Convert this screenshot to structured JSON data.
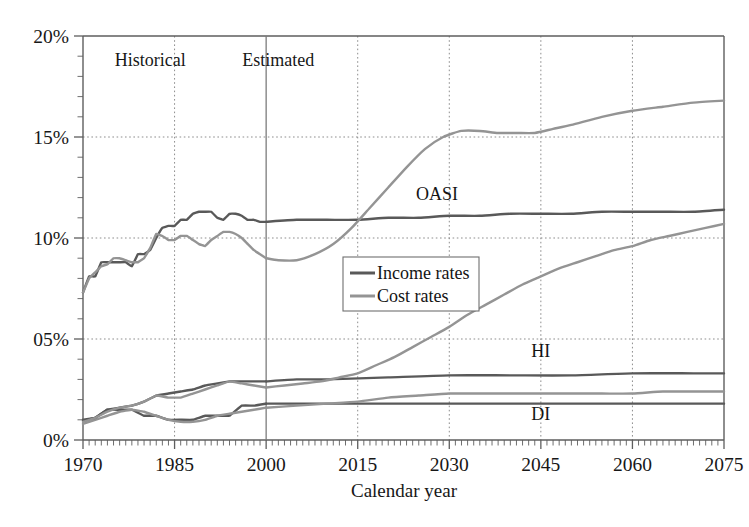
{
  "chart_data": {
    "type": "line",
    "title": "",
    "xlabel": "Calendar year",
    "ylabel": "",
    "xlim": [
      1970,
      2075
    ],
    "ylim": [
      0,
      20
    ],
    "grid": true,
    "grid_style": "dotted",
    "legend_position": "center",
    "x_ticks": [
      "1970",
      "1985",
      "2000",
      "2015",
      "2030",
      "2045",
      "2060",
      "2075"
    ],
    "x_tick_values": [
      1970,
      1985,
      2000,
      2015,
      2030,
      2045,
      2060,
      2075
    ],
    "y_ticks": [
      "0%",
      "05%",
      "10%",
      "15%",
      "20%"
    ],
    "y_tick_values": [
      0,
      5,
      10,
      15,
      20
    ],
    "minor_tick_interval_x": 1,
    "legend": [
      {
        "name": "Income rates",
        "color": "#595959"
      },
      {
        "name": "Cost rates",
        "color": "#949494"
      }
    ],
    "annotations": [
      {
        "text": "Historical",
        "x": 1981,
        "y": 18.5
      },
      {
        "text": "Estimated",
        "x": 2002,
        "y": 18.5
      },
      {
        "text": "OASI",
        "x": 2028,
        "y": 11.9
      },
      {
        "text": "HI",
        "x": 2045,
        "y": 4.1
      },
      {
        "text": "DI",
        "x": 2045,
        "y": 1.0
      }
    ],
    "divider": {
      "x": 2000,
      "label": "historical-estimated-divider",
      "color": "#7c7c7c"
    },
    "series": [
      {
        "name": "OASI income rate",
        "group": "OASI",
        "kind": "income",
        "color": "#595959",
        "x": [
          1970,
          1971,
          1972,
          1973,
          1974,
          1975,
          1976,
          1977,
          1978,
          1979,
          1980,
          1981,
          1982,
          1983,
          1984,
          1985,
          1986,
          1987,
          1988,
          1989,
          1990,
          1991,
          1992,
          1993,
          1994,
          1995,
          1996,
          1997,
          1998,
          1999,
          2000,
          2005,
          2010,
          2015,
          2020,
          2025,
          2030,
          2035,
          2040,
          2045,
          2050,
          2055,
          2060,
          2065,
          2070,
          2075
        ],
        "y": [
          7.3,
          8.1,
          8.1,
          8.8,
          8.8,
          8.8,
          8.8,
          8.8,
          8.6,
          9.2,
          9.2,
          9.4,
          10.0,
          10.5,
          10.6,
          10.6,
          10.9,
          10.9,
          11.2,
          11.3,
          11.3,
          11.3,
          11.0,
          10.9,
          11.2,
          11.2,
          11.1,
          10.9,
          10.9,
          10.8,
          10.8,
          10.9,
          10.9,
          10.9,
          11.0,
          11.0,
          11.1,
          11.1,
          11.2,
          11.2,
          11.2,
          11.3,
          11.3,
          11.3,
          11.3,
          11.4
        ]
      },
      {
        "name": "OASI cost rate",
        "group": "OASI",
        "kind": "cost",
        "color": "#949494",
        "x": [
          1970,
          1971,
          1972,
          1973,
          1974,
          1975,
          1976,
          1977,
          1978,
          1979,
          1980,
          1981,
          1982,
          1983,
          1984,
          1985,
          1986,
          1987,
          1988,
          1989,
          1990,
          1991,
          1992,
          1993,
          1994,
          1995,
          1996,
          1997,
          1998,
          1999,
          2000,
          2002,
          2005,
          2008,
          2011,
          2014,
          2017,
          2020,
          2023,
          2026,
          2029,
          2032,
          2035,
          2038,
          2041,
          2044,
          2047,
          2050,
          2055,
          2060,
          2065,
          2070,
          2075
        ],
        "y": [
          7.3,
          8.0,
          8.3,
          8.6,
          8.7,
          9.0,
          9.0,
          8.9,
          8.8,
          8.8,
          9.0,
          9.5,
          10.2,
          10.1,
          9.9,
          9.9,
          10.1,
          10.1,
          9.9,
          9.7,
          9.6,
          9.9,
          10.1,
          10.3,
          10.3,
          10.2,
          10.0,
          9.7,
          9.4,
          9.2,
          9.0,
          8.9,
          8.9,
          9.2,
          9.7,
          10.5,
          11.5,
          12.5,
          13.5,
          14.4,
          15.0,
          15.3,
          15.3,
          15.2,
          15.2,
          15.2,
          15.4,
          15.6,
          16.0,
          16.3,
          16.5,
          16.7,
          16.8
        ]
      },
      {
        "name": "DI income rate",
        "group": "DI",
        "kind": "income",
        "color": "#595959",
        "x": [
          1970,
          1972,
          1974,
          1976,
          1978,
          1980,
          1982,
          1984,
          1986,
          1988,
          1990,
          1992,
          1994,
          1996,
          1998,
          2000,
          2005,
          2010,
          2020,
          2030,
          2040,
          2050,
          2060,
          2070,
          2075
        ],
        "y": [
          0.95,
          1.1,
          1.5,
          1.5,
          1.5,
          1.2,
          1.2,
          1.0,
          1.0,
          1.0,
          1.2,
          1.2,
          1.2,
          1.7,
          1.7,
          1.8,
          1.8,
          1.8,
          1.8,
          1.8,
          1.8,
          1.8,
          1.8,
          1.8,
          1.8
        ]
      },
      {
        "name": "DI cost rate",
        "group": "DI",
        "kind": "cost",
        "color": "#949494",
        "x": [
          1970,
          1972,
          1974,
          1976,
          1978,
          1980,
          1982,
          1984,
          1986,
          1988,
          1990,
          1992,
          1994,
          1996,
          1998,
          2000,
          2005,
          2010,
          2015,
          2020,
          2025,
          2030,
          2035,
          2040,
          2045,
          2050,
          2055,
          2060,
          2065,
          2070,
          2075
        ],
        "y": [
          0.8,
          1.0,
          1.2,
          1.4,
          1.5,
          1.4,
          1.2,
          1.0,
          0.9,
          0.9,
          1.0,
          1.2,
          1.3,
          1.4,
          1.5,
          1.6,
          1.7,
          1.8,
          1.9,
          2.1,
          2.2,
          2.3,
          2.3,
          2.3,
          2.3,
          2.3,
          2.3,
          2.3,
          2.4,
          2.4,
          2.4
        ]
      },
      {
        "name": "HI income rate",
        "group": "HI",
        "kind": "income",
        "color": "#595959",
        "x": [
          1970,
          1972,
          1974,
          1976,
          1978,
          1980,
          1982,
          1984,
          1986,
          1988,
          1990,
          1992,
          1994,
          1996,
          1998,
          2000,
          2005,
          2010,
          2020,
          2030,
          2040,
          2050,
          2060,
          2070,
          2075
        ],
        "y": [
          1.0,
          1.1,
          1.5,
          1.6,
          1.7,
          1.9,
          2.2,
          2.3,
          2.4,
          2.5,
          2.7,
          2.8,
          2.9,
          2.9,
          2.9,
          2.9,
          3.0,
          3.0,
          3.1,
          3.2,
          3.2,
          3.2,
          3.3,
          3.3,
          3.3
        ]
      },
      {
        "name": "HI cost rate",
        "group": "HI",
        "kind": "cost",
        "color": "#949494",
        "x": [
          1970,
          1972,
          1974,
          1976,
          1978,
          1980,
          1982,
          1984,
          1986,
          1988,
          1990,
          1992,
          1994,
          1996,
          1998,
          2000,
          2003,
          2006,
          2009,
          2012,
          2015,
          2018,
          2021,
          2024,
          2027,
          2030,
          2033,
          2036,
          2039,
          2042,
          2045,
          2048,
          2051,
          2054,
          2057,
          2060,
          2063,
          2066,
          2069,
          2072,
          2075
        ],
        "y": [
          0.9,
          1.1,
          1.4,
          1.6,
          1.7,
          1.9,
          2.2,
          2.1,
          2.1,
          2.3,
          2.5,
          2.7,
          2.9,
          2.8,
          2.7,
          2.6,
          2.7,
          2.8,
          2.9,
          3.1,
          3.3,
          3.7,
          4.1,
          4.6,
          5.1,
          5.6,
          6.2,
          6.7,
          7.2,
          7.7,
          8.1,
          8.5,
          8.8,
          9.1,
          9.4,
          9.6,
          9.9,
          10.1,
          10.3,
          10.5,
          10.7
        ]
      }
    ]
  }
}
